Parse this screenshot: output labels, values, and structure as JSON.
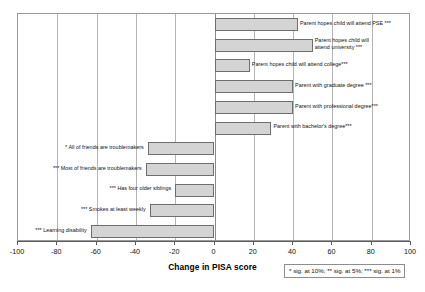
{
  "chart_data": {
    "type": "bar",
    "orientation": "horizontal",
    "title": "",
    "xlabel": "Change in PISA score",
    "ylabel": "",
    "xlim": [
      -100,
      100
    ],
    "xticks": [
      -100,
      -80,
      -60,
      -40,
      -20,
      0,
      20,
      40,
      60,
      80,
      100
    ],
    "xtick_labels": [
      "-100",
      "-80",
      "-60",
      "-40",
      "-20",
      "0",
      "20",
      "40",
      "60",
      "80",
      "100"
    ],
    "grid": true,
    "legend": "",
    "annotation": "* sig. at 10%; ** sig. at 5%; *** sig. at 1%",
    "categories": [
      "Parent hopes child will attend PSE ***",
      "Parent hopes child will attend university ***",
      "Parent hopes child will attend college***",
      "Parent with graduate degree ***",
      "Parent with professional degree***",
      "Parent with bachelor's degree***",
      "* All of friends are troublemakers",
      "*** Most of friends are troublemakers",
      "*** Has four older siblings",
      "*** Smokes at least weekly",
      "*** Learning disability"
    ],
    "values": [
      42.5,
      50,
      18,
      40,
      40,
      29,
      -34,
      -35,
      -20,
      -33,
      -63
    ]
  },
  "bars": [
    {
      "label": "Parent hopes child will attend PSE ***",
      "label_lines": [
        "Parent hopes child will attend PSE ***"
      ],
      "value": 42.5,
      "side": "right"
    },
    {
      "label": "Parent hopes child will attend university ***",
      "label_lines": [
        "Parent hopes child will",
        "attend university ***"
      ],
      "value": 50,
      "side": "right"
    },
    {
      "label": "Parent hopes child will attend college***",
      "label_lines": [
        "Parent hopes child will attend college***"
      ],
      "value": 18,
      "side": "right"
    },
    {
      "label": "Parent with graduate degree ***",
      "label_lines": [
        "Parent with graduate degree ***"
      ],
      "value": 40,
      "side": "right"
    },
    {
      "label": "Parent with professional degree***",
      "label_lines": [
        "Parent with professional degree***"
      ],
      "value": 40,
      "side": "right"
    },
    {
      "label": "Parent with bachelor's degree***",
      "label_lines": [
        "Parent with bachelor's degree***"
      ],
      "value": 29,
      "side": "right"
    },
    {
      "label": "* All of friends are troublemakers",
      "label_lines": [
        "* All of friends are troublemakers"
      ],
      "value": -34,
      "side": "left"
    },
    {
      "label": "*** Most of friends are troublemakers",
      "label_lines": [
        "*** Most of friends are troublemakers"
      ],
      "value": -35,
      "side": "left"
    },
    {
      "label": "*** Has four older siblings",
      "label_lines": [
        "*** Has four older siblings"
      ],
      "value": -20,
      "side": "left"
    },
    {
      "label": "*** Smokes at least weekly",
      "label_lines": [
        "*** Smokes at least weekly"
      ],
      "value": -33,
      "side": "left"
    },
    {
      "label": "*** Learning disability",
      "label_lines": [
        "*** Learning disability"
      ],
      "value": -63,
      "side": "left"
    }
  ],
  "axis": {
    "title": "Change in PISA score",
    "ticks": [
      "-100",
      "-80",
      "-60",
      "-40",
      "-20",
      "0",
      "20",
      "40",
      "60",
      "80",
      "100"
    ]
  },
  "note": {
    "text": "* sig. at 10%; ** sig. at 5%; *** sig. at 1%"
  },
  "colors": {
    "bar_fill": "#d4d4d4",
    "bar_stroke": "#6e6e6e",
    "gridline": "#b5b5b5",
    "axis": "#5c5c5c",
    "text": "#111111"
  }
}
